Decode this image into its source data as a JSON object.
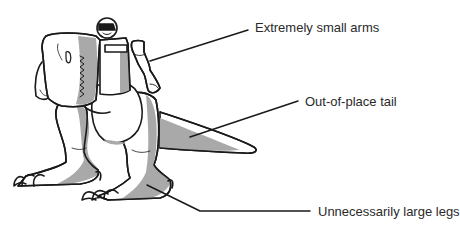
{
  "diagram": {
    "colors": {
      "outline": "#1a1a1a",
      "shade": "#a9a9a9",
      "fill": "#ffffff",
      "text": "#2a2a2a"
    },
    "callouts": [
      {
        "id": "arms",
        "label": "Extremely small arms"
      },
      {
        "id": "tail",
        "label": "Out-of-place tail"
      },
      {
        "id": "legs",
        "label": "Unnecessarily large legs"
      }
    ]
  }
}
